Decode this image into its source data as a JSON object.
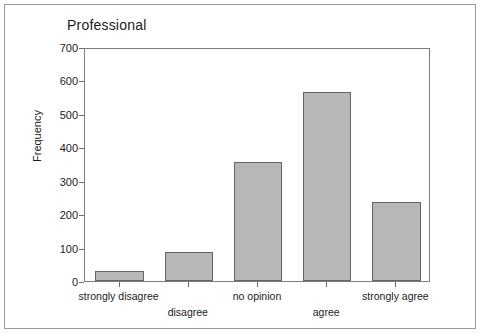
{
  "chart_data": {
    "type": "bar",
    "title": "Professional",
    "xlabel": "",
    "ylabel": "Frequency",
    "categories": [
      "strongly disagree",
      "disagree",
      "no opinion",
      "agree",
      "strongly agree"
    ],
    "values": [
      29,
      88,
      355,
      565,
      235
    ],
    "ylim": [
      0,
      700
    ],
    "yticks": [
      0,
      100,
      200,
      300,
      400,
      500,
      600,
      700
    ],
    "ytick_labels": [
      "0",
      "100",
      "200",
      "300",
      "400",
      "500",
      "600",
      "700"
    ],
    "grid": false,
    "legend": null,
    "bar_color": "#b7b7b7",
    "bar_border_color": "#646464",
    "axis_color": "#7d7d7d",
    "background_color": "#ffffff",
    "label_stagger": [
      "top",
      "bottom",
      "top",
      "bottom",
      "top"
    ]
  }
}
